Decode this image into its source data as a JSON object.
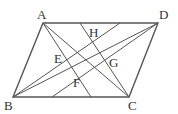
{
  "diagram": {
    "type": "geometry-parallelogram",
    "colors": {
      "stroke": "#555555",
      "label": "#333333",
      "background": "#ffffff"
    },
    "points": {
      "A": {
        "label": "A",
        "x": 43,
        "y": 23
      },
      "D": {
        "label": "D",
        "x": 158,
        "y": 23
      },
      "B": {
        "label": "B",
        "x": 13,
        "y": 97
      },
      "C": {
        "label": "C",
        "x": 129,
        "y": 97
      },
      "E": {
        "label": "E"
      },
      "F": {
        "label": "F"
      },
      "G": {
        "label": "G"
      },
      "H": {
        "label": "H"
      }
    },
    "segments": [
      "AD",
      "DC",
      "CB",
      "BA",
      "AC",
      "BD",
      "top-bottom-line-through-H-G",
      "top-bottom-line-through-E-F"
    ]
  }
}
